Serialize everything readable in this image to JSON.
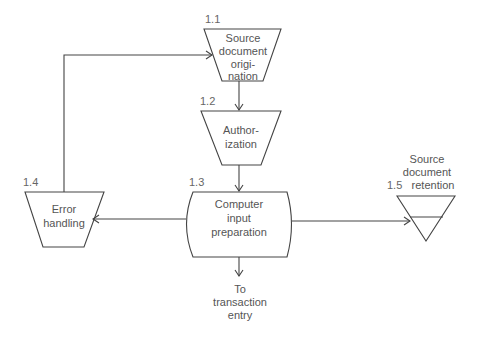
{
  "diagram": {
    "type": "flowchart",
    "colors": {
      "stroke": "#444444",
      "text": "#555555",
      "background": "#ffffff"
    },
    "nodes": {
      "n11": {
        "number": "1.1",
        "shape": "manual-operation-trapezoid",
        "lines": [
          "Source",
          "document",
          "origi-",
          "nation"
        ]
      },
      "n12": {
        "number": "1.2",
        "shape": "manual-operation-trapezoid",
        "lines": [
          "Author-",
          "ization"
        ]
      },
      "n13": {
        "number": "1.3",
        "shape": "stored-data-terminal",
        "lines": [
          "Computer",
          "input",
          "preparation"
        ]
      },
      "n14": {
        "number": "1.4",
        "shape": "manual-operation-trapezoid",
        "lines": [
          "Error",
          "handling"
        ]
      },
      "n15": {
        "number": "1.5",
        "shape": "offline-storage-triangle",
        "lines": [
          "Source",
          "document",
          "retention"
        ]
      }
    },
    "terminal": {
      "lines": [
        "To",
        "transaction",
        "entry"
      ]
    },
    "edges": [
      {
        "from": "1.1",
        "to": "1.2"
      },
      {
        "from": "1.2",
        "to": "1.3"
      },
      {
        "from": "1.3",
        "to": "1.4"
      },
      {
        "from": "1.3",
        "to": "1.5"
      },
      {
        "from": "1.3",
        "to": "To transaction entry"
      },
      {
        "from": "1.4",
        "to": "1.1"
      }
    ]
  }
}
